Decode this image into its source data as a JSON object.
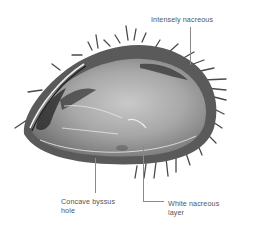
{
  "figure": {
    "colors": {
      "background": "#ffffff",
      "label_text": "#555555",
      "leader_line": "#8a8a8a",
      "shell_dark": "#2a2a2a",
      "shell_mid": "#8c8c8c",
      "shell_light": "#c8c8c8"
    }
  },
  "annotations": [
    {
      "id": "intensely-nacreous",
      "text": "Intensely nacreous"
    },
    {
      "id": "concave-byssus-hole",
      "line1": "Concave byssus",
      "line2": "hole"
    },
    {
      "id": "white-nacreous-layer",
      "line1": "White nacreous",
      "line2": "layer"
    }
  ]
}
